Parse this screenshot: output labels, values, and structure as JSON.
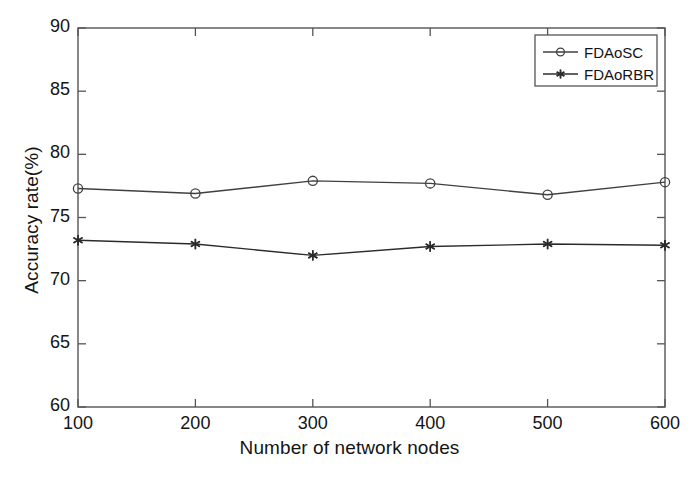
{
  "chart_data": {
    "type": "line",
    "title": "",
    "xlabel": "Number of network nodes",
    "ylabel": "Accuracy rate(%)",
    "x": [
      100,
      200,
      300,
      400,
      500,
      600
    ],
    "xtick_labels": [
      "100",
      "200",
      "300",
      "400",
      "500",
      "600"
    ],
    "ytick_labels": [
      "60",
      "65",
      "70",
      "75",
      "80",
      "85",
      "90"
    ],
    "yticks": [
      60,
      65,
      70,
      75,
      80,
      85,
      90
    ],
    "xlim": [
      100,
      600
    ],
    "ylim": [
      60,
      90
    ],
    "grid": false,
    "legend_position": "top-right",
    "series": [
      {
        "name": "FDAoSC",
        "marker": "circle",
        "color": "#404040",
        "values": [
          77.3,
          76.9,
          77.9,
          77.7,
          76.8,
          77.8
        ]
      },
      {
        "name": "FDAoRBR",
        "marker": "asterisk",
        "color": "#2b2b2b",
        "values": [
          73.2,
          72.9,
          72.0,
          72.7,
          72.9,
          72.8
        ]
      }
    ]
  },
  "figure": {
    "axis_color": "#555555",
    "background": "#ffffff",
    "text_color": "#141414"
  }
}
